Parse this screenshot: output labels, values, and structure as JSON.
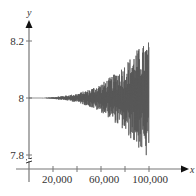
{
  "chart_data": {
    "type": "line",
    "title": "",
    "xlabel": "x",
    "ylabel": "y",
    "xlim": [
      0,
      110000
    ],
    "ylim": [
      7.78,
      8.25
    ],
    "y_axis_break": true,
    "grid": false,
    "legend": null,
    "x_ticks": [
      20000,
      40000,
      60000,
      80000,
      100000
    ],
    "x_tick_labels": [
      "20,000",
      "",
      "60,000",
      "",
      "100,000"
    ],
    "y_ticks": [
      7.8,
      8,
      8.2
    ],
    "y_tick_labels": [
      "7.8",
      "8",
      "8.2"
    ],
    "series": [
      {
        "name": "y",
        "color": "#555555",
        "description": "Oscillates around y = 8 with amplitude growing with x; nearly flat until ~20,000, reaching about 8.2 / 7.8 near x = 100,000",
        "envelope_x": [
          0,
          10000,
          20000,
          30000,
          40000,
          50000,
          60000,
          70000,
          80000,
          90000,
          100000
        ],
        "envelope_upper": [
          8.0,
          8.0,
          8.003,
          8.008,
          8.015,
          8.03,
          8.05,
          8.08,
          8.12,
          8.17,
          8.2
        ],
        "envelope_lower": [
          8.0,
          8.0,
          7.997,
          7.992,
          7.985,
          7.97,
          7.95,
          7.92,
          7.88,
          7.83,
          7.78
        ]
      }
    ]
  },
  "labels": {
    "x_axis": "x",
    "y_axis": "y",
    "y_8_2": "8.2",
    "y_8": "8",
    "y_7_8": "7.8",
    "x_20000": "20,000",
    "x_60000": "60,000",
    "x_100000": "100,000"
  }
}
